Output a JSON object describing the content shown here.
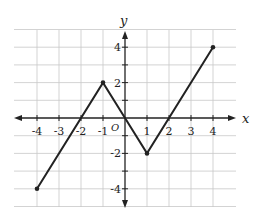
{
  "chart_data": {
    "type": "line",
    "title": "",
    "xlabel": "x",
    "ylabel": "y",
    "origin_label": "O",
    "xlim": [
      -5,
      5
    ],
    "ylim": [
      -5,
      5
    ],
    "grid": true,
    "x_ticks": [
      -4,
      -3,
      -2,
      -1,
      1,
      2,
      3,
      4
    ],
    "x_tick_labels": [
      "-4",
      "-3",
      "-2",
      "-1",
      "1",
      "2",
      "3",
      "4"
    ],
    "y_ticks": [
      4,
      2,
      -2,
      -4
    ],
    "y_tick_labels": [
      "4",
      "2",
      "-2",
      "-4"
    ],
    "series": [
      {
        "name": "piecewise linear graph",
        "x": [
          -4,
          -1,
          0,
          1,
          4
        ],
        "y": [
          -4,
          2,
          0,
          -2,
          4
        ],
        "endpoints": [
          [
            -4,
            -4
          ],
          [
            4,
            4
          ]
        ],
        "color": "#222222"
      }
    ]
  }
}
